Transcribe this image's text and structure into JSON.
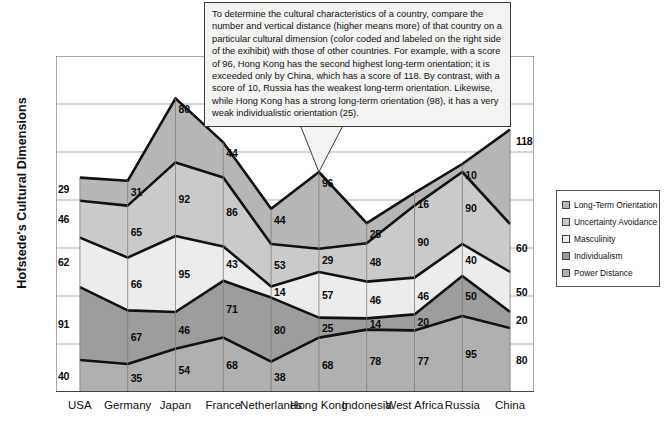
{
  "ylabel": "Hofstede's Cultural Dimensions",
  "annotation": "To determine the cultural characteristics of a country, compare the number and vertical distance (higher means more) of that country on a particular cultural dimension (color coded and labeled on the right side of the exihibit) with those of other countries.  For example, with a score of 96, Hong Kong has the second highest long-term orientation; it is exceeded only by China, which has a score of 118.  By contrast, with a score of 10, Russia has the weakest long-term orientation.  Likewise, while Hong Kong has a strong long-term orientation (98), it has a very weak individualistic orientation (25).",
  "chart_data": {
    "type": "area",
    "title": "",
    "xlabel": "",
    "ylabel": "Hofstede's Cultural Dimensions",
    "stacked": true,
    "grid": true,
    "legend_position": "right",
    "ylim": [
      0,
      420
    ],
    "categories": [
      "USA",
      "Germany",
      "Japan",
      "France",
      "Netherlands",
      "Hong Kong",
      "Indonesia",
      "West Africa",
      "Russia",
      "China"
    ],
    "series": [
      {
        "name": "Power Distance",
        "color": "#b0b0b0",
        "values": [
          40,
          35,
          54,
          68,
          38,
          68,
          78,
          77,
          95,
          80
        ]
      },
      {
        "name": "Individualism",
        "color": "#9d9d9d",
        "values": [
          91,
          67,
          46,
          71,
          80,
          25,
          14,
          20,
          50,
          20
        ]
      },
      {
        "name": "Masculinity",
        "color": "#ececec",
        "values": [
          62,
          66,
          95,
          43,
          14,
          57,
          46,
          46,
          40,
          50
        ]
      },
      {
        "name": "Uncertainty Avoidance",
        "color": "#cacaca",
        "values": [
          46,
          65,
          92,
          86,
          53,
          29,
          48,
          90,
          90,
          60
        ]
      },
      {
        "name": "Long-Term Orientation",
        "color": "#b6b6b6",
        "values": [
          29,
          31,
          80,
          44,
          44,
          96,
          25,
          16,
          10,
          118
        ]
      }
    ],
    "legend": [
      {
        "label": "Long-Term Orientation",
        "color": "#b6b6b6"
      },
      {
        "label": "Uncertainty Avoidance",
        "color": "#cacaca"
      },
      {
        "label": "Masculinity",
        "color": "#ececec"
      },
      {
        "label": "Individualism",
        "color": "#9d9d9d"
      },
      {
        "label": "Power Distance",
        "color": "#b0b0b0"
      }
    ]
  }
}
